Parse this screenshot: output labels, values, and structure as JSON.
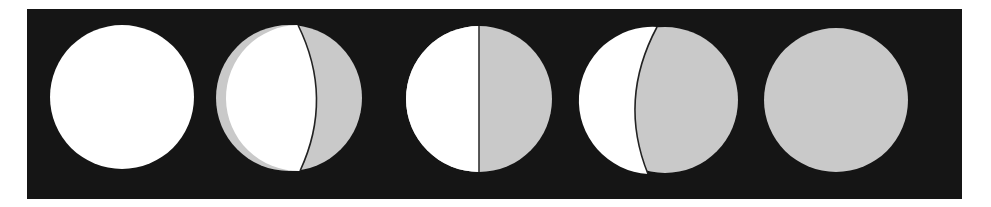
{
  "diagram": {
    "title": "",
    "background": "#151515",
    "lit_color": "#ffffff",
    "shadow_color": "#c9c9c9",
    "terminator_color": "#222222",
    "phases": [
      {
        "name": "full-lit",
        "cx": 122,
        "cy": 97,
        "r": 72,
        "lit_fraction": 1.0
      },
      {
        "name": "mostly-lit",
        "cx": 289,
        "cy": 98,
        "r": 73,
        "lit_fraction": 0.7
      },
      {
        "name": "half-lit",
        "cx": 479,
        "cy": 99,
        "r": 73,
        "lit_fraction": 0.5
      },
      {
        "name": "crescent-lit",
        "cx": 665,
        "cy": 100,
        "r": 73,
        "lit_fraction": 0.3
      },
      {
        "name": "dark",
        "cx": 836,
        "cy": 100,
        "r": 72,
        "lit_fraction": 0.0
      }
    ]
  }
}
